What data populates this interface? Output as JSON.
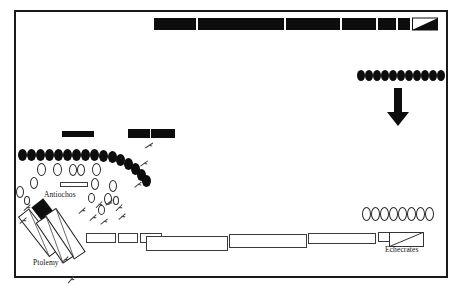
{
  "figure": {
    "labels": [
      {
        "id": "antiochos",
        "text": "Antiochos",
        "x": 44,
        "y": 190
      },
      {
        "id": "ptolemy",
        "text": "Ptolemy",
        "x": 33,
        "y": 258
      },
      {
        "id": "echecrates",
        "text": "Echecrates",
        "x": 385,
        "y": 245
      }
    ],
    "colors": {
      "ink": "#0d0d0d",
      "outline": "#2a2a2a",
      "paper": "#ffffff",
      "frame": "#1a1a1a"
    }
  },
  "frame": {
    "x": 14,
    "y": 10,
    "width": 434,
    "height": 268
  },
  "top_line": {
    "name": "antiochos-phalanx-line",
    "y": 18,
    "height": 12,
    "blocks": [
      {
        "x": 154,
        "w": 42,
        "fill": "black"
      },
      {
        "x": 198,
        "w": 86,
        "fill": "black"
      },
      {
        "x": 286,
        "w": 54,
        "fill": "black"
      },
      {
        "x": 342,
        "w": 34,
        "fill": "black"
      },
      {
        "x": 378,
        "w": 18,
        "fill": "black"
      },
      {
        "x": 398,
        "w": 12,
        "fill": "black"
      },
      {
        "x": 412,
        "w": 26,
        "fill": "wedge"
      }
    ]
  },
  "bottom_line": {
    "name": "ptolemaic-phalanx-line",
    "y": 233,
    "height": 13,
    "blocks": [
      {
        "x": 86,
        "w": 30,
        "fill": "white",
        "y": 233,
        "h": 10
      },
      {
        "x": 118,
        "w": 20,
        "fill": "white",
        "y": 233,
        "h": 10
      },
      {
        "x": 140,
        "w": 22,
        "fill": "white",
        "y": 233,
        "h": 10
      },
      {
        "x": 146,
        "w": 82,
        "fill": "white",
        "y": 236,
        "h": 15
      },
      {
        "x": 229,
        "w": 78,
        "fill": "white",
        "y": 234,
        "h": 14
      },
      {
        "x": 308,
        "w": 68,
        "fill": "white",
        "y": 233,
        "h": 11
      },
      {
        "x": 378,
        "w": 44,
        "fill": "white",
        "y": 232,
        "h": 10
      },
      {
        "x": 389,
        "w": 34,
        "fill": "wedge-open",
        "y": 232,
        "h": 14
      }
    ]
  },
  "mid_bars": [
    {
      "name": "black-bar-left",
      "x": 62,
      "y": 131,
      "w": 32,
      "h": 6,
      "fill": "black"
    },
    {
      "name": "black-bar-mid-a",
      "x": 128,
      "y": 129,
      "w": 22,
      "h": 9,
      "fill": "black"
    },
    {
      "name": "black-bar-mid-b",
      "x": 151,
      "y": 129,
      "w": 24,
      "h": 9,
      "fill": "black"
    },
    {
      "name": "white-bar-antiochos",
      "x": 60,
      "y": 182,
      "w": 28,
      "h": 5,
      "fill": "white"
    }
  ],
  "cavalry_groups": [
    {
      "name": "left-elephant-row",
      "style": "filled",
      "count": 17,
      "ovals": [
        {
          "x": 18,
          "y": 149,
          "w": 9,
          "h": 12
        },
        {
          "x": 27,
          "y": 149,
          "w": 9,
          "h": 12
        },
        {
          "x": 36,
          "y": 149,
          "w": 9,
          "h": 12
        },
        {
          "x": 45,
          "y": 149,
          "w": 9,
          "h": 12
        },
        {
          "x": 54,
          "y": 149,
          "w": 9,
          "h": 12
        },
        {
          "x": 63,
          "y": 149,
          "w": 9,
          "h": 12
        },
        {
          "x": 72,
          "y": 149,
          "w": 9,
          "h": 12
        },
        {
          "x": 81,
          "y": 149,
          "w": 9,
          "h": 12
        },
        {
          "x": 90,
          "y": 149,
          "w": 9,
          "h": 12
        },
        {
          "x": 99,
          "y": 150,
          "w": 9,
          "h": 12
        },
        {
          "x": 108,
          "y": 151,
          "w": 9,
          "h": 12
        },
        {
          "x": 116,
          "y": 154,
          "w": 9,
          "h": 12
        },
        {
          "x": 124,
          "y": 158,
          "w": 9,
          "h": 12
        },
        {
          "x": 131,
          "y": 163,
          "w": 9,
          "h": 12
        },
        {
          "x": 137,
          "y": 169,
          "w": 9,
          "h": 12
        },
        {
          "x": 142,
          "y": 175,
          "w": 9,
          "h": 12
        }
      ]
    },
    {
      "name": "left-outline-cavalry",
      "style": "outline",
      "count": 14,
      "ovals": [
        {
          "x": 37,
          "y": 163,
          "w": 9,
          "h": 13
        },
        {
          "x": 53,
          "y": 163,
          "w": 9,
          "h": 13
        },
        {
          "x": 69,
          "y": 164,
          "w": 8,
          "h": 12
        },
        {
          "x": 77,
          "y": 164,
          "w": 8,
          "h": 12
        },
        {
          "x": 92,
          "y": 163,
          "w": 9,
          "h": 13
        },
        {
          "x": 30,
          "y": 177,
          "w": 8,
          "h": 12
        },
        {
          "x": 16,
          "y": 186,
          "w": 8,
          "h": 12
        },
        {
          "x": 91,
          "y": 178,
          "w": 8,
          "h": 12
        },
        {
          "x": 109,
          "y": 180,
          "w": 8,
          "h": 12
        },
        {
          "x": 104,
          "y": 193,
          "w": 8,
          "h": 12
        },
        {
          "x": 88,
          "y": 193,
          "w": 7,
          "h": 10
        },
        {
          "x": 98,
          "y": 205,
          "w": 7,
          "h": 10
        },
        {
          "x": 24,
          "y": 196,
          "w": 6,
          "h": 9
        },
        {
          "x": 113,
          "y": 196,
          "w": 6,
          "h": 9
        }
      ]
    },
    {
      "name": "top-right-elephant-row",
      "style": "filled",
      "count": 11,
      "ovals": [
        {
          "x": 357,
          "y": 70,
          "w": 8,
          "h": 11
        },
        {
          "x": 365,
          "y": 70,
          "w": 8,
          "h": 11
        },
        {
          "x": 373,
          "y": 70,
          "w": 8,
          "h": 11
        },
        {
          "x": 381,
          "y": 70,
          "w": 8,
          "h": 11
        },
        {
          "x": 389,
          "y": 70,
          "w": 8,
          "h": 11
        },
        {
          "x": 397,
          "y": 70,
          "w": 8,
          "h": 11
        },
        {
          "x": 405,
          "y": 70,
          "w": 8,
          "h": 11
        },
        {
          "x": 413,
          "y": 70,
          "w": 8,
          "h": 11
        },
        {
          "x": 421,
          "y": 70,
          "w": 8,
          "h": 11
        },
        {
          "x": 429,
          "y": 70,
          "w": 8,
          "h": 11
        },
        {
          "x": 437,
          "y": 70,
          "w": 8,
          "h": 11
        }
      ]
    },
    {
      "name": "bottom-right-outline-row",
      "style": "outline",
      "count": 8,
      "ovals": [
        {
          "x": 362,
          "y": 207,
          "w": 9,
          "h": 14
        },
        {
          "x": 371,
          "y": 207,
          "w": 9,
          "h": 14
        },
        {
          "x": 380,
          "y": 207,
          "w": 9,
          "h": 14
        },
        {
          "x": 389,
          "y": 207,
          "w": 9,
          "h": 14
        },
        {
          "x": 398,
          "y": 207,
          "w": 9,
          "h": 14
        },
        {
          "x": 407,
          "y": 207,
          "w": 9,
          "h": 14
        },
        {
          "x": 416,
          "y": 207,
          "w": 9,
          "h": 14
        },
        {
          "x": 425,
          "y": 207,
          "w": 9,
          "h": 14
        }
      ]
    }
  ],
  "arrow": {
    "name": "advance-arrow",
    "x": 397,
    "y": 88,
    "length": 38,
    "direction": "down"
  },
  "diagonals": [
    {
      "name": "antiochos-wedge-black",
      "x": 46,
      "y": 196,
      "w": 14,
      "h": 52,
      "rot": -38,
      "fill": "black-split"
    },
    {
      "name": "antiochos-wedge-outline",
      "x": 32,
      "y": 206,
      "w": 13,
      "h": 50,
      "rot": -38,
      "fill": "white"
    },
    {
      "name": "ptolemy-wedge-a",
      "x": 58,
      "y": 206,
      "w": 13,
      "h": 52,
      "rot": -34,
      "fill": "white"
    },
    {
      "name": "ptolemy-wedge-b",
      "x": 48,
      "y": 214,
      "w": 12,
      "h": 48,
      "rot": -34,
      "fill": "white"
    }
  ],
  "skirmish_marks": [
    {
      "x": 146,
      "y": 141,
      "rot": 30
    },
    {
      "x": 141,
      "y": 159,
      "rot": 28
    },
    {
      "x": 135,
      "y": 180,
      "rot": 25
    },
    {
      "x": 24,
      "y": 203,
      "rot": 20
    },
    {
      "x": 20,
      "y": 216,
      "rot": 22
    },
    {
      "x": 96,
      "y": 200,
      "rot": 18
    },
    {
      "x": 106,
      "y": 198,
      "rot": 24
    },
    {
      "x": 90,
      "y": 213,
      "rot": 20
    },
    {
      "x": 101,
      "y": 217,
      "rot": 26
    },
    {
      "x": 116,
      "y": 203,
      "rot": 18
    },
    {
      "x": 119,
      "y": 212,
      "rot": 22
    },
    {
      "x": 62,
      "y": 255,
      "rot": 20
    },
    {
      "x": 68,
      "y": 275,
      "rot": 14
    },
    {
      "x": 79,
      "y": 206,
      "rot": 20
    }
  ]
}
